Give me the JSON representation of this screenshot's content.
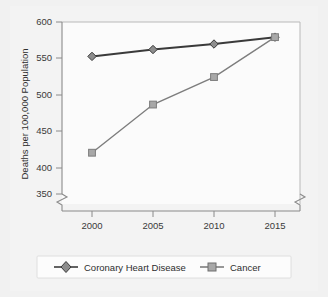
{
  "chart_data": {
    "type": "line",
    "title": "",
    "subtitle": "",
    "xlabel": "",
    "ylabel": "Deaths per 100,000 Population",
    "x": [
      2000,
      2005,
      2010,
      2015
    ],
    "categories": [
      "2000",
      "2005",
      "2010",
      "2015"
    ],
    "xtick_labels": [
      "2000",
      "2005",
      "2010",
      "2015"
    ],
    "ytick_labels": [
      "350",
      "400",
      "450",
      "500",
      "550",
      "600"
    ],
    "yticks": [
      350,
      400,
      450,
      500,
      550,
      600
    ],
    "ylim": [
      350,
      600
    ],
    "xlim": [
      1998,
      2017
    ],
    "y_axis_broken": true,
    "x_axis_broken": true,
    "grid": false,
    "legend_position": "bottom",
    "series": [
      {
        "name": "Coronary Heart Disease",
        "values": [
          550,
          560,
          568,
          578
        ],
        "color": "#3a3a3a",
        "marker": "diamond",
        "marker_fill": "#8d8d8d"
      },
      {
        "name": "Cancer",
        "values": [
          410,
          480,
          520,
          578
        ],
        "color": "#7d7d7d",
        "marker": "square",
        "marker_fill": "#a8a8a8"
      }
    ]
  },
  "legend": {
    "items": [
      {
        "label": "Coronary Heart Disease",
        "marker": "diamond-marker"
      },
      {
        "label": "Cancer",
        "marker": "square-marker"
      }
    ]
  },
  "axes": {
    "y_title": "Deaths per 100,000 Population",
    "y_ticks": [
      {
        "label": "600",
        "value": 600
      },
      {
        "label": "550",
        "value": 550
      },
      {
        "label": "500",
        "value": 500
      },
      {
        "label": "450",
        "value": 450
      },
      {
        "label": "400",
        "value": 400
      },
      {
        "label": "350",
        "value": 350
      }
    ],
    "x_ticks": [
      {
        "label": "2000",
        "value": 2000
      },
      {
        "label": "2005",
        "value": 2005
      },
      {
        "label": "2010",
        "value": 2010
      },
      {
        "label": "2015",
        "value": 2015
      }
    ]
  },
  "colors": {
    "background": "#f1f1f1",
    "plot_background": "#fbfbfb",
    "axis": "#8a8a8a",
    "frame": "#b9b9b9",
    "series_chd": "#3a3a3a",
    "series_cancer": "#7d7d7d",
    "text": "#2e2e2e"
  }
}
